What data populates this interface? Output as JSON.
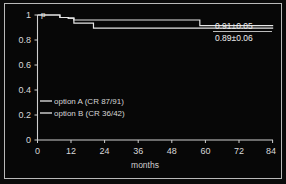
{
  "chart_data": {
    "type": "line",
    "title": "",
    "subtitle": "",
    "xlabel": "months",
    "ylabel": "p",
    "xlim": [
      0,
      84
    ],
    "ylim": [
      0,
      1
    ],
    "xticks": [
      "0",
      "12",
      "24",
      "36",
      "48",
      "60",
      "72",
      "84"
    ],
    "xtick_values": [
      0,
      12,
      24,
      36,
      48,
      60,
      72,
      84
    ],
    "yticks": [
      "0",
      "0.2",
      "0.4",
      "0.6",
      "0.8",
      "1"
    ],
    "ytick_values": [
      0,
      0.2,
      0.4,
      0.6,
      0.8,
      1
    ],
    "grid": false,
    "legend_position": "center-left",
    "style": "kaplan-meier step curves on black background",
    "series": [
      {
        "name": "option A (CR 87/91)",
        "legend_label": "option A (CR 87/91)",
        "color": "#e6e6e6",
        "end_annotation": "0.91±0.05",
        "end_value": 0.91,
        "end_error": 0.05,
        "steps": [
          {
            "x": 0,
            "y": 1.0
          },
          {
            "x": 5,
            "y": 1.0
          },
          {
            "x": 8,
            "y": 0.98
          },
          {
            "x": 11,
            "y": 0.975
          },
          {
            "x": 13,
            "y": 0.96
          },
          {
            "x": 56,
            "y": 0.96
          },
          {
            "x": 58,
            "y": 0.915
          },
          {
            "x": 84,
            "y": 0.91
          }
        ]
      },
      {
        "name": "option B (CR 36/42)",
        "legend_label": "option B (CR 36/42)",
        "color": "#e6e6e6",
        "end_annotation": "0.89±0.06",
        "end_value": 0.89,
        "end_error": 0.06,
        "steps": [
          {
            "x": 0,
            "y": 1.0
          },
          {
            "x": 5,
            "y": 1.0
          },
          {
            "x": 8,
            "y": 0.98
          },
          {
            "x": 11,
            "y": 0.975
          },
          {
            "x": 13,
            "y": 0.935
          },
          {
            "x": 18,
            "y": 0.935
          },
          {
            "x": 20,
            "y": 0.895
          },
          {
            "x": 84,
            "y": 0.89
          }
        ]
      }
    ],
    "annotations": [
      {
        "text": "0.91±0.05",
        "series": "option A (CR 87/91)"
      },
      {
        "text": "0.89±0.06",
        "series": "option B (CR 36/42)"
      }
    ]
  },
  "colors": {
    "background": "#070707",
    "frame": "#b9b9b9",
    "axis": "#cfcfcf",
    "curve": "#e6e6e6",
    "text": "#d8d8d8"
  }
}
